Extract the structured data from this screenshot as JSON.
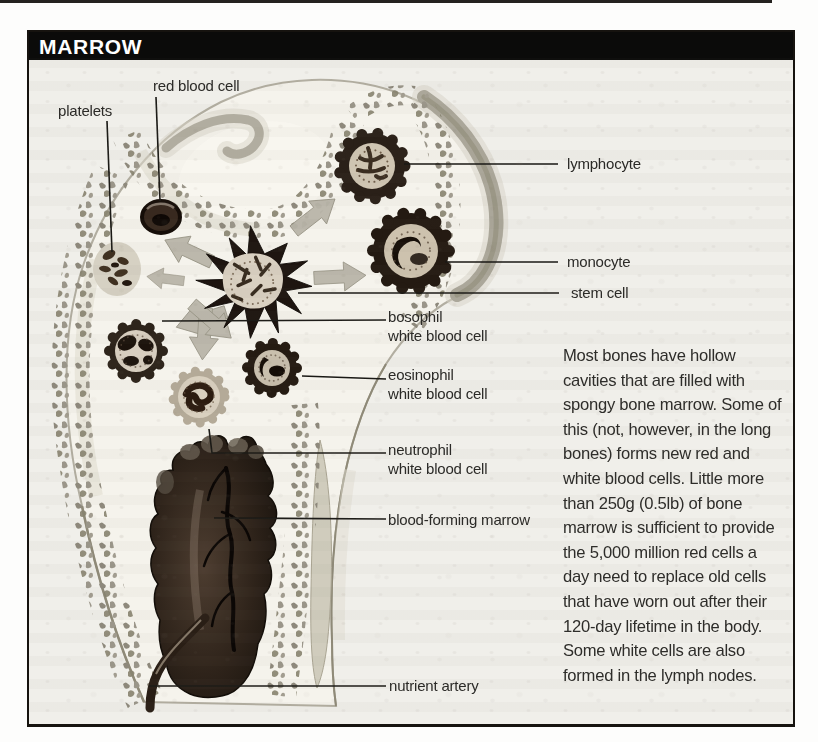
{
  "panel": {
    "title": "MARROW"
  },
  "figure": {
    "labels": {
      "platelets": "platelets",
      "red_blood_cell": "red blood cell",
      "lymphocyte": "lymphocyte",
      "monocyte": "monocyte",
      "stem_cell": "stem cell",
      "basophil": {
        "line1": "bosophil",
        "line2": "white blood cell"
      },
      "eosinophil": {
        "line1": "eosinophil",
        "line2": "white blood cell"
      },
      "neutrophil": {
        "line1": "neutrophil",
        "line2": "white blood cell"
      },
      "blood_forming_marrow": "blood-forming marrow",
      "nutrient_artery": "nutrient artery"
    }
  },
  "body": {
    "lines": [
      "Most bones have hollow",
      "cavities that are filled with",
      "spongy bone marrow. Some of",
      "this (not, however, in the long",
      "bones) forms new red and",
      "white blood cells. Little more",
      "than 250g (0.5lb) of bone",
      "marrow is sufficient to provide",
      "the 5,000 million red cells a",
      "day need to replace old cells",
      "that have worn out after their",
      "120-day lifetime in the body.",
      "Some white cells are also",
      "formed in the lymph nodes."
    ]
  },
  "colors": {
    "title_bg": "#0b0b0a",
    "title_fg": "#ffffff",
    "frame_border": "#16130f",
    "content_bg": "#f0efea",
    "bone_fill": "#f5f3ec",
    "leader_line": "#1a1915",
    "arrow_fill": "#b9b5a9",
    "marrow_dark": "#1c130d"
  }
}
